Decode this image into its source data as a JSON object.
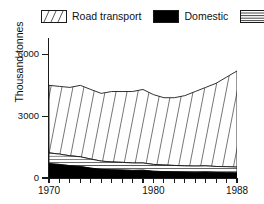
{
  "legend": {
    "entries": [
      {
        "label": "Road transport",
        "icon": "diagonal-hatch-swatch",
        "pattern": "diagonal"
      },
      {
        "label": "Domestic",
        "icon": "solid-black-swatch",
        "pattern": "solid"
      },
      {
        "label": "Other",
        "icon": "horizontal-hatch-swatch",
        "pattern": "horizontal"
      }
    ]
  },
  "chart_data": {
    "type": "area",
    "stacked": true,
    "title": "",
    "xlabel": "",
    "ylabel": "Thousand tonnes",
    "xlim": [
      1970,
      1988
    ],
    "ylim": [
      0,
      6800
    ],
    "grid": false,
    "legend_position": "top",
    "x": [
      1970,
      1971,
      1972,
      1973,
      1974,
      1975,
      1976,
      1977,
      1978,
      1979,
      1980,
      1981,
      1982,
      1983,
      1984,
      1985,
      1986,
      1987,
      1988
    ],
    "xticks": [
      1970,
      1971,
      1972,
      1973,
      1974,
      1975,
      1976,
      1977,
      1978,
      1979,
      1980,
      1981,
      1982,
      1983,
      1984,
      1985,
      1986,
      1987,
      1988
    ],
    "xtick_labels": [
      "1970",
      "",
      "",
      "",
      "",
      "",
      "",
      "",
      "",
      "",
      "1980",
      "",
      "",
      "",
      "",
      "",
      "",
      "",
      "1988"
    ],
    "yticks": [
      0,
      3000,
      6000
    ],
    "ytick_labels": [
      "0",
      "3000",
      "6000"
    ],
    "series": [
      {
        "name": "Domestic",
        "pattern": "solid",
        "values": [
          700,
          660,
          600,
          560,
          480,
          420,
          400,
          390,
          370,
          380,
          330,
          310,
          300,
          290,
          280,
          290,
          270,
          260,
          250
        ]
      },
      {
        "name": "Other",
        "pattern": "horizontal",
        "values": [
          520,
          500,
          480,
          470,
          440,
          400,
          380,
          370,
          360,
          350,
          330,
          320,
          310,
          300,
          300,
          300,
          290,
          290,
          280
        ]
      },
      {
        "name": "Road transport",
        "pattern": "diagonal",
        "values": [
          3280,
          3290,
          3320,
          3470,
          3380,
          3290,
          3420,
          3440,
          3470,
          3570,
          3390,
          3270,
          3290,
          3410,
          3620,
          3810,
          4040,
          4350,
          4670
        ]
      }
    ],
    "totals": [
      4500,
      4450,
      4400,
      4500,
      4300,
      4110,
      4200,
      4200,
      4200,
      4300,
      4050,
      3900,
      3900,
      4000,
      4200,
      4400,
      4600,
      4900,
      5200
    ]
  },
  "colors": {
    "ink": "#1a1a1a",
    "fill_black": "#000000",
    "background": "#ffffff",
    "hatch_line": "#555555"
  }
}
